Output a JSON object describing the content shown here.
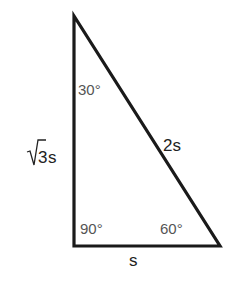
{
  "diagram": {
    "colors": {
      "background": "#ffffff",
      "stroke": "#1a1a1a",
      "angle_text": "#555555",
      "side_text": "#222222"
    },
    "vertices": {
      "top": [
        74,
        16
      ],
      "right_angle": [
        74,
        246
      ],
      "bottom_right": [
        220,
        246
      ]
    },
    "angles": {
      "top": "30°",
      "right_angle": "90°",
      "bottom_right": "60°"
    },
    "sides": {
      "vertical_leg": {
        "radical": "√",
        "radicand": "3",
        "variable": "s",
        "full": "√3s"
      },
      "hypotenuse": "2s",
      "base": "s"
    }
  }
}
